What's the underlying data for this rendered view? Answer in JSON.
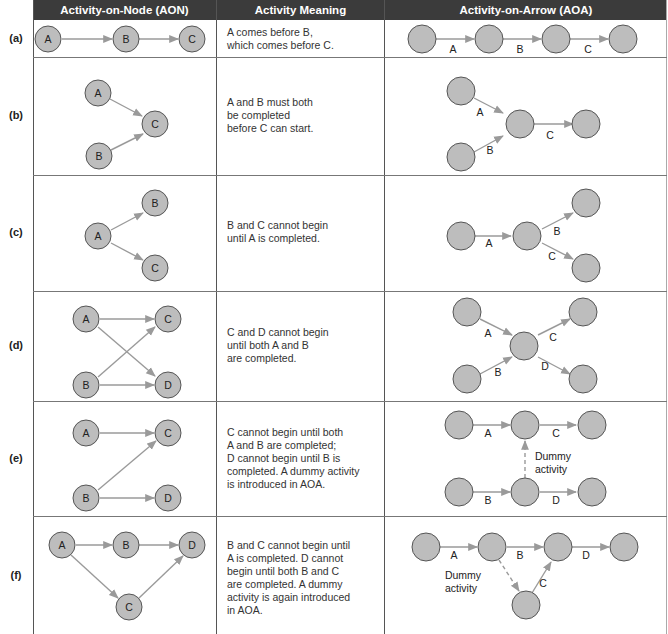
{
  "headers": {
    "aon": "Activity-on-Node (AON)",
    "meaning": "Activity Meaning",
    "aoa": "Activity-on-Arrow (AOA)"
  },
  "colors": {
    "header_bg": "#3b3b3b",
    "node_fill": "#bdbdbd",
    "arrow": "#9a9a9a"
  },
  "rows": [
    {
      "label": "(a)",
      "meaning": [
        "A comes before B,",
        "which comes before C."
      ],
      "aon_nodes": [
        "A",
        "B",
        "C"
      ],
      "aoa_edges": [
        "A",
        "B",
        "C"
      ]
    },
    {
      "label": "(b)",
      "meaning": [
        "A and B must both",
        "be completed",
        "before C can start."
      ],
      "aon_nodes": [
        "A",
        "B",
        "C"
      ],
      "aoa_edges": [
        "A",
        "B",
        "C"
      ]
    },
    {
      "label": "(c)",
      "meaning": [
        "B and C cannot begin",
        "until A is completed."
      ],
      "aon_nodes": [
        "A",
        "B",
        "C"
      ],
      "aoa_edges": [
        "A",
        "B",
        "C"
      ]
    },
    {
      "label": "(d)",
      "meaning": [
        "C and D cannot begin",
        "until both A and B",
        "are completed."
      ],
      "aon_nodes": [
        "A",
        "B",
        "C",
        "D"
      ],
      "aoa_edges": [
        "A",
        "B",
        "C",
        "D"
      ]
    },
    {
      "label": "(e)",
      "meaning": [
        "C cannot begin until both",
        "A and B are completed;",
        "D cannot begin until B is",
        "completed. A dummy activity",
        "is introduced in AOA."
      ],
      "aon_nodes": [
        "A",
        "B",
        "C",
        "D"
      ],
      "aoa_edges": [
        "A",
        "B",
        "C",
        "D"
      ],
      "dummy_label": [
        "Dummy",
        "activity"
      ]
    },
    {
      "label": "(f)",
      "meaning": [
        "B and C cannot begin until",
        "A is completed. D cannot",
        "begin until both B and C",
        "are completed. A dummy",
        "activity is again introduced",
        "in AOA."
      ],
      "aon_nodes": [
        "A",
        "B",
        "C",
        "D"
      ],
      "aoa_edges": [
        "A",
        "B",
        "C",
        "D"
      ],
      "dummy_label": [
        "Dummy",
        "activity"
      ]
    }
  ]
}
